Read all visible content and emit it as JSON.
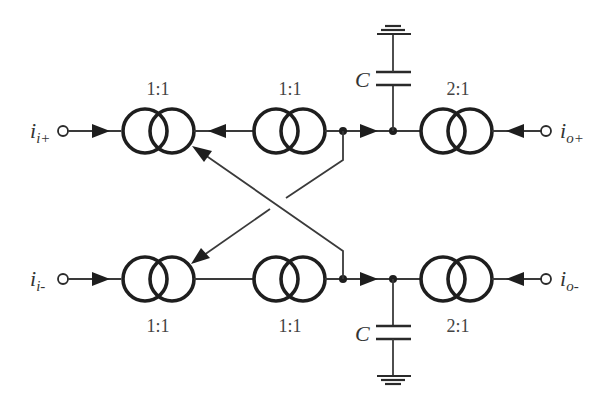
{
  "diagram": {
    "type": "current-mode circuit schematic",
    "inputs": {
      "top": {
        "symbol": "i",
        "subscript": "i+"
      },
      "bottom": {
        "symbol": "i",
        "subscript": "i-"
      }
    },
    "outputs": {
      "top": {
        "symbol": "i",
        "subscript": "o+"
      },
      "bottom": {
        "symbol": "i",
        "subscript": "o-"
      }
    },
    "current_mirrors": {
      "top": [
        {
          "ratio": "1:1"
        },
        {
          "ratio": "1:1"
        },
        {
          "ratio": "2:1"
        }
      ],
      "bottom": [
        {
          "ratio": "1:1"
        },
        {
          "ratio": "1:1"
        },
        {
          "ratio": "2:1"
        }
      ]
    },
    "capacitors": {
      "top": {
        "label": "C"
      },
      "bottom": {
        "label": "C"
      }
    },
    "colors": {
      "stroke": "#1e1e1e",
      "wire": "#3a3a3a",
      "background": "#ffffff"
    }
  }
}
